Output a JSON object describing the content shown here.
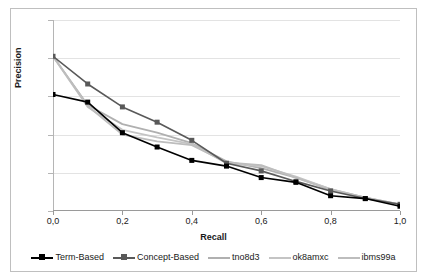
{
  "chart_data": {
    "type": "line",
    "title": "",
    "xlabel": "Recall",
    "ylabel": "Precision",
    "xlim": [
      0.0,
      1.0
    ],
    "ylim": [
      0.0,
      1.0
    ],
    "xticks": [
      "0,0",
      "0,2",
      "0,4",
      "0,6",
      "0,8",
      "1,0"
    ],
    "xtick_values": [
      0.0,
      0.2,
      0.4,
      0.6,
      0.8,
      1.0
    ],
    "yticks": [
      "0,0",
      "0,2",
      "0,4",
      "0,6",
      "0,8",
      "1,0"
    ],
    "ytick_values": [
      0.0,
      0.2,
      0.4,
      0.6,
      0.8,
      1.0
    ],
    "grid": "horizontal",
    "legend_position": "bottom",
    "decimal_separator": ",",
    "x": [
      0.0,
      0.1,
      0.2,
      0.3,
      0.4,
      0.5,
      0.6,
      0.7,
      0.8,
      0.9,
      1.0
    ],
    "series": [
      {
        "name": "Term-Based",
        "color": "#000000",
        "marker": "square-filled",
        "values": [
          0.61,
          0.57,
          0.41,
          0.335,
          0.265,
          0.235,
          0.175,
          0.15,
          0.08,
          0.065,
          0.025
        ]
      },
      {
        "name": "Concept-Based",
        "color": "#595959",
        "marker": "square-filled",
        "values": [
          0.81,
          0.665,
          0.545,
          0.465,
          0.37,
          0.25,
          0.21,
          0.155,
          0.105,
          0.065,
          0.035
        ]
      },
      {
        "name": "tno8d3",
        "color": "#b0b0b0",
        "marker": "none",
        "values": [
          0.81,
          0.555,
          0.455,
          0.41,
          0.355,
          0.26,
          0.225,
          0.175,
          0.115,
          0.07,
          0.035
        ]
      },
      {
        "name": "ok8amxc",
        "color": "#c4c4c4",
        "marker": "none",
        "values": [
          0.81,
          0.545,
          0.425,
          0.385,
          0.35,
          0.25,
          0.235,
          0.18,
          0.115,
          0.07,
          0.035
        ]
      },
      {
        "name": "ibms99a",
        "color": "#bdbdbd",
        "marker": "none",
        "values": [
          0.81,
          0.55,
          0.4,
          0.365,
          0.345,
          0.255,
          0.24,
          0.175,
          0.11,
          0.07,
          0.035
        ]
      }
    ]
  }
}
